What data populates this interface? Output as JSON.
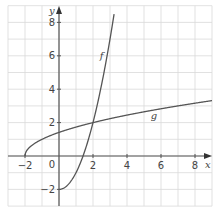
{
  "chart_data": {
    "type": "line",
    "title": "",
    "xlabel": "x",
    "ylabel": "y",
    "xlim": [
      -3,
      9
    ],
    "ylim": [
      -3,
      9
    ],
    "grid": true,
    "x_ticks": [
      "-2",
      "0",
      "2",
      "4",
      "6",
      "8"
    ],
    "y_ticks": [
      "-2",
      "2",
      "4",
      "6",
      "8"
    ],
    "series": [
      {
        "name": "f",
        "description": "f(x) = x^2 - 2 for x >= 0",
        "x": [
          0,
          0.5,
          1,
          1.5,
          2,
          2.5,
          3.27
        ],
        "y": [
          -2,
          -1.75,
          -1,
          0.25,
          2,
          4.25,
          8.7
        ]
      },
      {
        "name": "g",
        "description": "g(x) = sqrt(x + 2) for x >= -2",
        "x": [
          -2,
          -1.5,
          -1,
          0,
          1,
          2,
          4,
          6,
          8,
          9
        ],
        "y": [
          0,
          0.71,
          1,
          1.41,
          1.73,
          2,
          2.45,
          2.83,
          3.16,
          3.32
        ]
      }
    ],
    "annotations": [
      {
        "text": "f",
        "x": 2.4,
        "y": 5.8
      },
      {
        "text": "g",
        "x": 5.4,
        "y": 2.2
      }
    ],
    "colors": {
      "grid": "#d9d9d9",
      "axis": "#555555",
      "curve": "#555555"
    }
  }
}
